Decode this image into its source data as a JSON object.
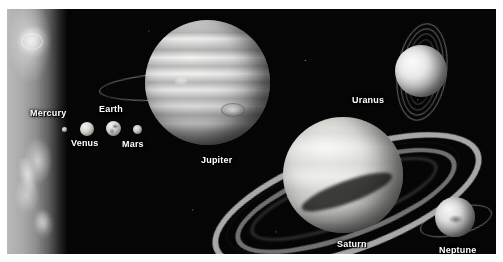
{
  "figure": {
    "background_color": "#050505",
    "border_color": "#ffffff",
    "label_color": "#ffffff"
  },
  "sun": {
    "name": "Sun",
    "position": "left-edge-limb",
    "visible_label": ""
  },
  "planets": [
    {
      "label": "Mercury",
      "order": 1,
      "relative_size": "smallest",
      "has_rings": false,
      "body_tone": "#b6b6b6"
    },
    {
      "label": "Venus",
      "order": 2,
      "relative_size": "small",
      "has_rings": false,
      "body_tone": "#d7d6d2"
    },
    {
      "label": "Earth",
      "order": 3,
      "relative_size": "small",
      "has_rings": false,
      "body_tone": "#cfcfcf"
    },
    {
      "label": "Mars",
      "order": 4,
      "relative_size": "small",
      "has_rings": false,
      "body_tone": "#c2c2c2"
    },
    {
      "label": "Jupiter",
      "order": 5,
      "relative_size": "largest",
      "has_rings": true,
      "features": "banded cloud belts, Great Red Spot",
      "body_tone": "#dedede"
    },
    {
      "label": "Saturn",
      "order": 6,
      "relative_size": "very large",
      "has_rings": true,
      "features": "prominent tilted ring system with Cassini division",
      "body_tone": "#e8e8e4"
    },
    {
      "label": "Uranus",
      "order": 7,
      "relative_size": "medium",
      "has_rings": true,
      "features": "near-vertical narrow rings",
      "body_tone": "#eaeaea"
    },
    {
      "label": "Neptune",
      "order": 8,
      "relative_size": "medium",
      "has_rings": true,
      "features": "thin ring, dark spot",
      "body_tone": "#e0e0e0"
    }
  ]
}
